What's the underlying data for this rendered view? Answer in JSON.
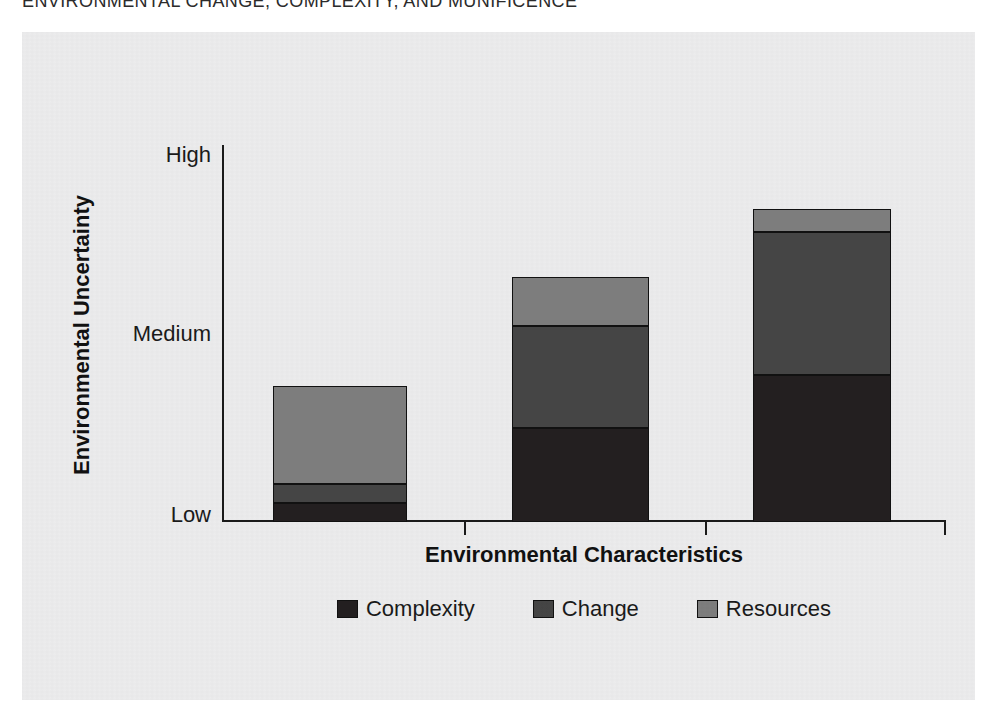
{
  "page": {
    "running_header": "ENVIRONMENTAL CHANGE, COMPLEXITY, AND MUNIFICENCE",
    "background_color": "#ffffff",
    "panel_color": "#ececed"
  },
  "chart_data": {
    "type": "bar",
    "stacked": true,
    "title": "",
    "xlabel": "Environmental Characteristics",
    "ylabel": "Environmental Uncertainty",
    "categories": [
      "1",
      "2",
      "3"
    ],
    "ytick_labels": [
      "Low",
      "Medium",
      "High"
    ],
    "ytick_values": [
      0,
      50,
      100
    ],
    "ylim": [
      0,
      100
    ],
    "grid": false,
    "legend_position": "bottom",
    "series": [
      {
        "name": "Complexity",
        "color": "#231f20",
        "values": [
          5,
          25,
          39
        ]
      },
      {
        "name": "Change",
        "color": "#454545",
        "values": [
          5,
          27,
          38
        ]
      },
      {
        "name": "Resources",
        "color": "#7d7d7d",
        "values": [
          26,
          13,
          6
        ]
      }
    ],
    "totals": [
      36,
      65,
      83
    ]
  },
  "axes": {
    "y_title": "Environmental Uncertainty",
    "x_title": "Environmental Characteristics",
    "y_labels": {
      "high": "High",
      "medium": "Medium",
      "low": "Low"
    },
    "axis_color": "#1a1a1a"
  },
  "legend": {
    "items": [
      {
        "label": "Complexity",
        "color": "#231f20"
      },
      {
        "label": "Change",
        "color": "#454545"
      },
      {
        "label": "Resources",
        "color": "#7d7d7d"
      }
    ]
  }
}
